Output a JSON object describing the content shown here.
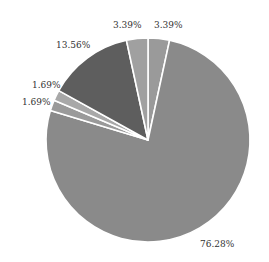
{
  "chart_data": {
    "type": "pie",
    "title": "",
    "start_angle_deg": 0,
    "direction": "clockwise",
    "slices": [
      {
        "label": "3.39%",
        "value": 3.39,
        "color": "#9a9a9a"
      },
      {
        "label": "76.28%",
        "value": 76.28,
        "color": "#8a8a8a"
      },
      {
        "label": "1.69%",
        "value": 1.69,
        "color": "#9a9a9a"
      },
      {
        "label": "1.69%",
        "value": 1.69,
        "color": "#a8a8a8"
      },
      {
        "label": "13.56%",
        "value": 13.56,
        "color": "#5e5e5e"
      },
      {
        "label": "3.39%",
        "value": 3.39,
        "color": "#a0a0a0"
      }
    ],
    "legend": "none",
    "grid": false
  },
  "labels": {
    "top_right": "3.39%",
    "top_left": "3.39%",
    "upper_left": "13.56%",
    "left_upper": "1.69%",
    "left_lower": "1.69%",
    "bottom_right": "76.28%"
  }
}
